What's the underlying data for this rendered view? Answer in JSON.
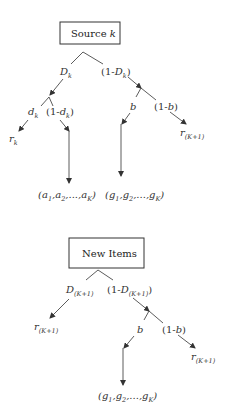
{
  "diagram_1": {
    "root": {
      "label": "Source ",
      "label_var": "k"
    },
    "branch_left": {
      "var": "D",
      "sub": "k"
    },
    "branch_right": {
      "pre": "(1-",
      "var": "D",
      "sub": "k",
      "post": ")"
    },
    "left_sub_left": {
      "var": "d",
      "sub": "k"
    },
    "left_sub_right": {
      "pre": "(1-",
      "var": "d",
      "sub": "k",
      "post": ")"
    },
    "right_sub_left": {
      "var": "b"
    },
    "right_sub_right": {
      "pre": "(1-",
      "var": "b",
      "post": ")"
    },
    "leaf_rk": {
      "var": "r",
      "sub": "k"
    },
    "leaf_a": {
      "text": "(a",
      "s1": "1",
      "m1": ",a",
      "s2": "2",
      "m2": ",...,a",
      "s3": "K",
      "post": ")"
    },
    "leaf_g": {
      "text": "(g",
      "s1": "1",
      "m1": ",g",
      "s2": "2",
      "m2": ",...,g",
      "s3": "K",
      "post": ")"
    },
    "leaf_rK1": {
      "var": "r",
      "sub": "(K+1)"
    }
  },
  "diagram_2": {
    "root": {
      "label": "New Items"
    },
    "branch_left": {
      "var": "D",
      "sub": "(K+1)"
    },
    "branch_right": {
      "pre": "(1-",
      "var": "D",
      "sub": "(K+1)",
      "post": ")"
    },
    "leaf_left": {
      "var": "r",
      "sub": "(K+1)"
    },
    "right_sub_left": {
      "var": "b"
    },
    "right_sub_right": {
      "pre": "(1-",
      "var": "b",
      "post": ")"
    },
    "leaf_g": {
      "text": "(g",
      "s1": "1",
      "m1": ",g",
      "s2": "2",
      "m2": ",...,g",
      "s3": "K",
      "post": ")"
    },
    "leaf_rK1": {
      "var": "r",
      "sub": "(K+1)"
    }
  }
}
